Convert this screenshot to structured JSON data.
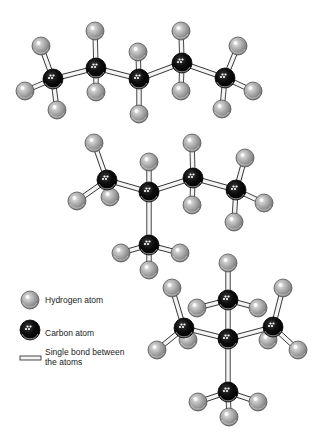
{
  "diagram": {
    "colors": {
      "background": "#ffffff",
      "hydrogen_fill": "#a8a8a8",
      "hydrogen_edge": "#555555",
      "carbon_fill": "#0b0b0b",
      "bond_fill": "#f4f4f4",
      "bond_edge": "#333333"
    },
    "radii": {
      "hydrogen": 9,
      "carbon": 10
    },
    "molecules": [
      {
        "name": "n-pentane",
        "carbons": [
          [
            53,
            79
          ],
          [
            96,
            68
          ],
          [
            139,
            79
          ],
          [
            182,
            63
          ],
          [
            225,
            78
          ]
        ],
        "hydrogens": [
          [
            41,
            46
          ],
          [
            25,
            91
          ],
          [
            57,
            110
          ],
          [
            95,
            31
          ],
          [
            96,
            92
          ],
          [
            138,
            52
          ],
          [
            139,
            114
          ],
          [
            181,
            31
          ],
          [
            181,
            91
          ],
          [
            238,
            46
          ],
          [
            253,
            91
          ],
          [
            222,
            109
          ]
        ],
        "bonds": [
          [
            0,
            1
          ],
          [
            1,
            2
          ],
          [
            2,
            3
          ],
          [
            3,
            4
          ]
        ],
        "ch_bonds": [
          [
            0,
            0
          ],
          [
            0,
            1
          ],
          [
            0,
            2
          ],
          [
            1,
            3
          ],
          [
            1,
            4
          ],
          [
            2,
            5
          ],
          [
            2,
            6
          ],
          [
            3,
            7
          ],
          [
            3,
            8
          ],
          [
            4,
            9
          ],
          [
            4,
            10
          ],
          [
            4,
            11
          ]
        ]
      },
      {
        "name": "isopentane",
        "carbons": [
          [
            107,
            180
          ],
          [
            149,
            192
          ],
          [
            193,
            178
          ],
          [
            236,
            190
          ],
          [
            149,
            245
          ]
        ],
        "hydrogens": [
          [
            94,
            143
          ],
          [
            77,
            201
          ],
          [
            149,
            162
          ],
          [
            192,
            143
          ],
          [
            192,
            205
          ],
          [
            245,
            158
          ],
          [
            264,
            203
          ],
          [
            234,
            222
          ],
          [
            121,
            253
          ],
          [
            180,
            253
          ],
          [
            149,
            270
          ],
          [
            110,
            197
          ]
        ],
        "bonds": [
          [
            0,
            1
          ],
          [
            1,
            2
          ],
          [
            2,
            3
          ],
          [
            1,
            4
          ]
        ],
        "ch_bonds": [
          [
            0,
            0
          ],
          [
            0,
            1
          ],
          [
            0,
            11
          ],
          [
            1,
            2
          ],
          [
            2,
            3
          ],
          [
            2,
            4
          ],
          [
            3,
            5
          ],
          [
            3,
            6
          ],
          [
            3,
            7
          ],
          [
            4,
            8
          ],
          [
            4,
            9
          ],
          [
            4,
            10
          ]
        ]
      },
      {
        "name": "neopentane",
        "carbons": [
          [
            228,
            300
          ],
          [
            184,
            328
          ],
          [
            228,
            339
          ],
          [
            273,
            327
          ],
          [
            228,
            392
          ]
        ],
        "hydrogens": [
          [
            228,
            263
          ],
          [
            197,
            308
          ],
          [
            258,
            308
          ],
          [
            172,
            288
          ],
          [
            157,
            350
          ],
          [
            188,
            340
          ],
          [
            283,
            288
          ],
          [
            298,
            350
          ],
          [
            268,
            340
          ],
          [
            198,
            402
          ],
          [
            258,
            402
          ],
          [
            229,
            417
          ]
        ],
        "bonds": [
          [
            2,
            0
          ],
          [
            2,
            1
          ],
          [
            2,
            3
          ],
          [
            2,
            4
          ]
        ],
        "ch_bonds": [
          [
            0,
            0
          ],
          [
            0,
            1
          ],
          [
            0,
            2
          ],
          [
            1,
            3
          ],
          [
            1,
            4
          ],
          [
            1,
            5
          ],
          [
            3,
            6
          ],
          [
            3,
            7
          ],
          [
            3,
            8
          ],
          [
            4,
            9
          ],
          [
            4,
            10
          ],
          [
            4,
            11
          ]
        ]
      }
    ],
    "legend": {
      "hydrogen": {
        "label": "Hydrogen atom",
        "icon": "hydrogen-atom-icon",
        "x": 30,
        "y": 300
      },
      "carbon": {
        "label": "Carbon atom",
        "icon": "carbon-atom-icon",
        "x": 30,
        "y": 330
      },
      "bond": {
        "label_line1": "Single bond between",
        "label_line2": "the atoms",
        "icon": "single-bond-icon",
        "x": 20,
        "y": 356,
        "w": 21,
        "h": 4
      }
    }
  }
}
